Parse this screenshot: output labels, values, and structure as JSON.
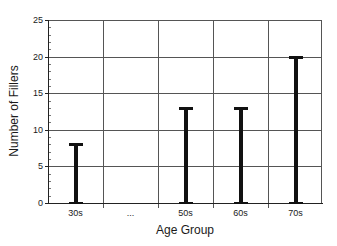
{
  "chart_data": {
    "type": "bar",
    "style": "range-bars (I-beam error-bar style, from 0 to value)",
    "title": "",
    "xlabel": "Age Group",
    "ylabel": "Number of Fillers",
    "categories": [
      "30s",
      "...",
      "50s",
      "60s",
      "70s"
    ],
    "values": [
      8,
      null,
      13,
      13,
      20
    ],
    "ylim": [
      0,
      25
    ],
    "yticks": [
      0,
      5,
      10,
      15,
      20,
      25
    ],
    "grid": true,
    "legend": null
  },
  "axes": {
    "x_title": "Age Group",
    "y_title": "Number of Fillers",
    "y_tick_labels": [
      "0",
      "5",
      "10",
      "15",
      "20",
      "25"
    ],
    "x_tick_labels": [
      "30s",
      "...",
      "50s",
      "60s",
      "70s"
    ]
  },
  "colors": {
    "bar": "#111111",
    "grid": "#555555",
    "background": "#ffffff"
  }
}
